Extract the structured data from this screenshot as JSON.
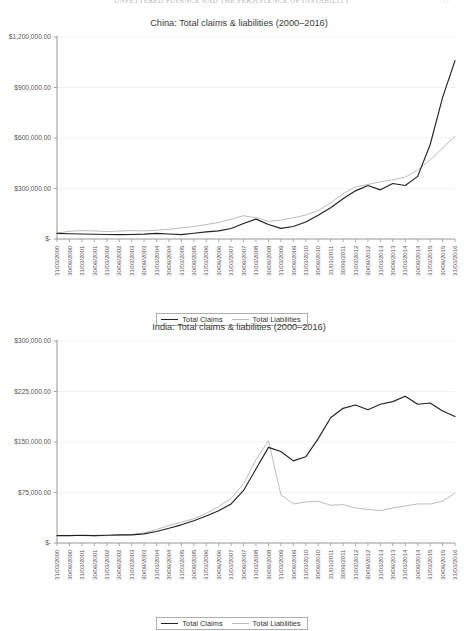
{
  "page_header": {
    "running_title": "UNFETTERED FINANCE AND THE PERSISTENCE OF INSTABILITY",
    "page_number": "77"
  },
  "legend": {
    "claims_label": "Total Claims",
    "liabilities_label": "Total Liabilities",
    "claims_color": "#222222",
    "liabilities_color": "#bdbdbd"
  },
  "x_tick_labels": [
    "31/03/2000",
    "30/09/2000",
    "31/03/2001",
    "30/09/2001",
    "31/03/2002",
    "30/09/2002",
    "31/03/2003",
    "30/09/2003",
    "31/03/2004",
    "30/09/2004",
    "31/03/2005",
    "30/09/2005",
    "31/03/2006",
    "30/09/2006",
    "31/03/2007",
    "30/09/2007",
    "31/03/2008",
    "30/09/2008",
    "31/03/2009",
    "30/09/2009",
    "31/03/2010",
    "30/09/2010",
    "31/03/2011",
    "30/09/2011",
    "31/03/2012",
    "30/09/2012",
    "31/03/2013",
    "30/09/2013",
    "31/03/2014",
    "30/09/2014",
    "31/03/2015",
    "30/09/2015",
    "31/03/2016"
  ],
  "chart_data": [
    {
      "type": "line",
      "title": "China: Total claims & liabilities (2000–2016)",
      "xlabel": "",
      "ylabel": "",
      "ylim": [
        0,
        1200000
      ],
      "ytick_labels": [
        "$1,200,000.00",
        "$900,000.00",
        "$600,000.00",
        "$300,000.00",
        "$-"
      ],
      "ytick_values": [
        1200000,
        900000,
        600000,
        300000,
        0
      ],
      "grid": true,
      "legend_position": "bottom",
      "categories": [
        "31/03/2000",
        "30/09/2000",
        "31/03/2001",
        "30/09/2001",
        "31/03/2002",
        "30/09/2002",
        "31/03/2003",
        "30/09/2003",
        "31/03/2004",
        "30/09/2004",
        "31/03/2005",
        "30/09/2005",
        "31/03/2006",
        "30/09/2006",
        "31/03/2007",
        "30/09/2007",
        "31/03/2008",
        "30/09/2008",
        "31/03/2009",
        "30/09/2009",
        "31/03/2010",
        "30/09/2010",
        "31/03/2011",
        "30/09/2011",
        "31/03/2012",
        "30/09/2012",
        "31/03/2013",
        "30/09/2013",
        "31/03/2014",
        "30/09/2014",
        "31/03/2015",
        "30/09/2015",
        "31/03/2016"
      ],
      "series": [
        {
          "name": "Total Claims",
          "color": "#222222",
          "values": [
            33000,
            31000,
            30000,
            28000,
            27000,
            26000,
            27000,
            29000,
            33000,
            30000,
            26000,
            34000,
            42000,
            48000,
            62000,
            92000,
            118000,
            86000,
            63000,
            74000,
            101000,
            141000,
            186000,
            239000,
            286000,
            318000,
            292000,
            330000,
            318000,
            372000,
            560000,
            840000,
            1060000
          ]
        },
        {
          "name": "Total Liabilities",
          "color": "#bdbdbd",
          "values": [
            35000,
            46000,
            50000,
            48000,
            44000,
            47000,
            50000,
            48000,
            52000,
            58000,
            66000,
            74000,
            86000,
            98000,
            118000,
            138000,
            126000,
            105000,
            112000,
            126000,
            142000,
            170000,
            214000,
            268000,
            310000,
            324000,
            340000,
            352000,
            368000,
            408000,
            470000,
            540000,
            610000
          ]
        }
      ]
    },
    {
      "type": "line",
      "title": "India: Total claims & liabilities (2000–2016)",
      "xlabel": "",
      "ylabel": "",
      "ylim": [
        0,
        300000
      ],
      "ytick_labels": [
        "$300,000.00",
        "$225,000.00",
        "$150,000.00",
        "$75,000.00",
        "$-"
      ],
      "ytick_values": [
        300000,
        225000,
        150000,
        75000,
        0
      ],
      "grid": true,
      "legend_position": "bottom",
      "categories": [
        "31/03/2000",
        "30/09/2000",
        "31/03/2001",
        "30/09/2001",
        "31/03/2002",
        "30/09/2002",
        "31/03/2003",
        "30/09/2003",
        "31/03/2004",
        "30/09/2004",
        "31/03/2005",
        "30/09/2005",
        "31/03/2006",
        "30/09/2006",
        "31/03/2007",
        "30/09/2007",
        "31/03/2008",
        "30/09/2008",
        "31/03/2009",
        "30/09/2009",
        "31/03/2010",
        "30/09/2010",
        "31/03/2011",
        "30/09/2011",
        "31/03/2012",
        "30/09/2012",
        "31/03/2013",
        "30/09/2013",
        "31/03/2014",
        "30/09/2014",
        "31/03/2015",
        "30/09/2015",
        "31/03/2016"
      ],
      "series": [
        {
          "name": "Total Claims",
          "color": "#222222",
          "values": [
            11000,
            11000,
            11500,
            11000,
            11500,
            12000,
            12000,
            13500,
            17000,
            22000,
            27000,
            33000,
            40000,
            48000,
            58000,
            78000,
            110000,
            142000,
            136000,
            122000,
            128000,
            155000,
            186000,
            200000,
            205000,
            198000,
            206000,
            210000,
            218000,
            206000,
            208000,
            196000,
            188000
          ]
        },
        {
          "name": "Total Liabilities",
          "color": "#bdbdbd",
          "values": [
            11000,
            11000,
            11000,
            10500,
            11000,
            11500,
            12500,
            15000,
            20000,
            26000,
            31000,
            36000,
            44000,
            54000,
            66000,
            88000,
            124000,
            152000,
            72000,
            58000,
            61000,
            62000,
            56000,
            57000,
            52000,
            50000,
            48000,
            52000,
            55000,
            58000,
            58000,
            62000,
            74000
          ]
        }
      ]
    }
  ]
}
